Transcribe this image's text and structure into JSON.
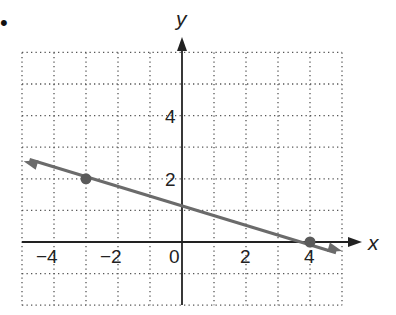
{
  "bullet": "•",
  "chart_data": {
    "type": "line",
    "title": "",
    "xlabel": "x",
    "ylabel": "y",
    "xlim": [
      -5,
      5
    ],
    "ylim": [
      -2,
      6
    ],
    "grid": true,
    "grid_style": "dotted",
    "x_ticks": [
      {
        "value": -4,
        "label": "−4"
      },
      {
        "value": -2,
        "label": "−2"
      },
      {
        "value": 0,
        "label": "0"
      },
      {
        "value": 2,
        "label": "2"
      },
      {
        "value": 4,
        "label": "4"
      }
    ],
    "y_ticks": [
      {
        "value": 2,
        "label": "2"
      },
      {
        "value": 4,
        "label": "4"
      }
    ],
    "series": [
      {
        "name": "line through (-3, 2) and (4, 0)",
        "points": [
          {
            "x": -3,
            "y": 2
          },
          {
            "x": 4,
            "y": 0
          }
        ],
        "slope": -0.2857,
        "y_intercept": 1.1429,
        "color": "#6b6b6b",
        "arrows_both_ends": true
      }
    ]
  },
  "colors": {
    "axis": "#222222",
    "grid": "#555555",
    "line": "#6b6b6b",
    "point": "#5a5a5a"
  }
}
